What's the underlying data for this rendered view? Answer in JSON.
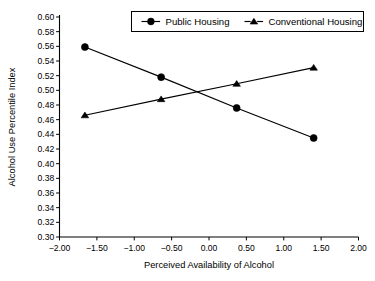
{
  "chart_data": {
    "type": "line",
    "title": "",
    "xlabel": "Perceived Availability of Alcohol",
    "ylabel": "Alcohol Use Percentile Index",
    "xlim": [
      -2.0,
      2.0
    ],
    "ylim": [
      0.3,
      0.6
    ],
    "xticks": [
      -2.0,
      -1.5,
      -1.0,
      -0.5,
      0.0,
      0.5,
      1.0,
      1.5,
      2.0
    ],
    "xticklabels": [
      "−2.00",
      "−1.50",
      "−1.00",
      "−0.50",
      "0.00",
      "0.50",
      "1.00",
      "1.50",
      "2.00"
    ],
    "yticks": [
      0.3,
      0.32,
      0.34,
      0.36,
      0.38,
      0.4,
      0.42,
      0.44,
      0.46,
      0.48,
      0.5,
      0.52,
      0.54,
      0.56,
      0.58,
      0.6
    ],
    "yticklabels": [
      "0.30",
      "0.32",
      "0.34",
      "0.36",
      "0.38",
      "0.40",
      "0.42",
      "0.44",
      "0.46",
      "0.48",
      "0.50",
      "0.52",
      "0.54",
      "0.56",
      "0.58",
      "0.60"
    ],
    "grid": false,
    "legend_position": "top-center",
    "x": [
      -1.66,
      -0.64,
      0.37,
      1.4
    ],
    "series": [
      {
        "name": "Public Housing",
        "marker": "circle",
        "values": [
          0.559,
          0.518,
          0.476,
          0.435
        ]
      },
      {
        "name": "Conventional Housing",
        "marker": "triangle",
        "values": [
          0.466,
          0.488,
          0.509,
          0.531
        ]
      }
    ]
  },
  "legend": {
    "items": [
      {
        "label": "Public Housing",
        "marker": "circle"
      },
      {
        "label": "Conventional Housing",
        "marker": "triangle"
      }
    ]
  },
  "colors": {
    "foreground": "#000000",
    "background": "#ffffff",
    "series_public_housing": "#000000",
    "series_conventional_housing": "#000000"
  }
}
